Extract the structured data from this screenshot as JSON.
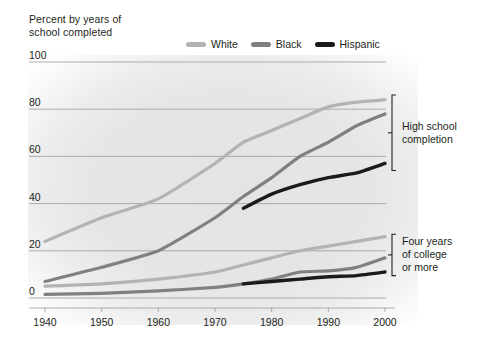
{
  "title": "Percent by years of\nschool completed",
  "legend": {
    "position": "top-right",
    "entries": [
      {
        "label": "White",
        "color": "#b3b3b3",
        "swatch_name": "legend-swatch-white"
      },
      {
        "label": "Black",
        "color": "#808080",
        "swatch_name": "legend-swatch-black"
      },
      {
        "label": "Hispanic",
        "color": "#1a1a1a",
        "swatch_name": "legend-swatch-hispanic"
      }
    ]
  },
  "annotations": [
    {
      "text": "High school\ncompletion",
      "name": "annotation-high-school-completion"
    },
    {
      "text": "Four years\nof college\nor more",
      "name": "annotation-four-years-college"
    }
  ],
  "axes": {
    "y_ticks": [
      "0",
      "20",
      "40",
      "60",
      "80",
      "100"
    ],
    "x_ticks": [
      "1940",
      "1950",
      "1960",
      "1970",
      "1980",
      "1990",
      "2000"
    ]
  },
  "chart_data": {
    "type": "line",
    "title": "Percent by years of school completed",
    "xlabel": "",
    "ylabel": "Percent by years of school completed",
    "xlim": [
      1940,
      2000
    ],
    "ylim": [
      0,
      100
    ],
    "y_ticks": [
      0,
      20,
      40,
      60,
      80,
      100
    ],
    "x_ticks": [
      1940,
      1950,
      1960,
      1970,
      1980,
      1990,
      2000
    ],
    "grid": "horizontal",
    "legend": [
      "White",
      "Black",
      "Hispanic"
    ],
    "groups": [
      {
        "name": "High school completion",
        "series": [
          {
            "name": "White",
            "color": "#b3b3b3",
            "x": [
              1940,
              1950,
              1960,
              1970,
              1975,
              1980,
              1985,
              1990,
              1995,
              2000
            ],
            "values": [
              24,
              34,
              42,
              57,
              66,
              71,
              76,
              81,
              83,
              84
            ]
          },
          {
            "name": "Black",
            "color": "#808080",
            "x": [
              1940,
              1950,
              1960,
              1970,
              1975,
              1980,
              1985,
              1990,
              1995,
              2000
            ],
            "values": [
              7,
              13,
              20,
              34,
              43,
              51,
              60,
              66,
              73,
              78
            ]
          },
          {
            "name": "Hispanic",
            "color": "#1a1a1a",
            "x": [
              1975,
              1980,
              1985,
              1990,
              1995,
              2000
            ],
            "values": [
              38,
              44,
              48,
              51,
              53,
              57
            ]
          }
        ]
      },
      {
        "name": "Four years of college or more",
        "series": [
          {
            "name": "White",
            "color": "#b3b3b3",
            "x": [
              1940,
              1950,
              1960,
              1970,
              1975,
              1980,
              1985,
              1990,
              1995,
              2000
            ],
            "values": [
              5,
              6,
              8,
              11,
              14,
              17,
              20,
              22,
              24,
              26
            ]
          },
          {
            "name": "Black",
            "color": "#808080",
            "x": [
              1940,
              1950,
              1960,
              1970,
              1975,
              1980,
              1985,
              1990,
              1995,
              2000
            ],
            "values": [
              1.5,
              2,
              3,
              4.5,
              6,
              8,
              11,
              11.5,
              13,
              17
            ]
          },
          {
            "name": "Hispanic",
            "color": "#1a1a1a",
            "x": [
              1975,
              1980,
              1985,
              1990,
              1995,
              2000
            ],
            "values": [
              6,
              7,
              8,
              9,
              9.5,
              11
            ]
          }
        ]
      }
    ]
  },
  "geometry": {
    "plot_left": 45,
    "plot_right": 385,
    "plot_top": 62,
    "plot_bottom": 298
  }
}
